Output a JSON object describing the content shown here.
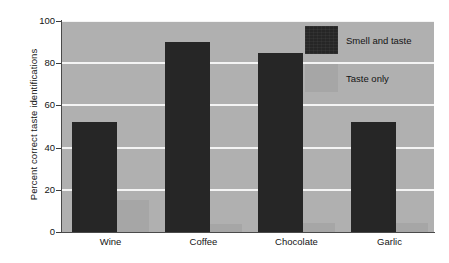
{
  "chart_data": {
    "type": "bar",
    "title": "",
    "xlabel": "",
    "ylabel": "Percent correct taste identifications",
    "categories": [
      "Wine",
      "Coffee",
      "Chocolate",
      "Garlic"
    ],
    "series": [
      {
        "name": "Smell and taste",
        "color": "#262626",
        "values": [
          52,
          90,
          85,
          52
        ]
      },
      {
        "name": "Taste only",
        "color": "#a6a6a6",
        "values": [
          15,
          4,
          4.5,
          4.5
        ]
      }
    ],
    "ylim": [
      0,
      100
    ],
    "yticks": [
      0,
      20,
      40,
      60,
      80,
      100
    ],
    "ytick_labels": [
      "0",
      "20",
      "40",
      "60",
      "80",
      "100"
    ],
    "grid": true,
    "grid_color": "#f4f4f4",
    "plot_background": "#b0b0b0",
    "figure_background": "#ffffff",
    "legend_position": "upper right"
  },
  "legend": {
    "entries": [
      {
        "label": "Smell and taste",
        "swatch": "dark-swatch-icon"
      },
      {
        "label": "Taste only",
        "swatch": "light-swatch-icon"
      }
    ]
  }
}
